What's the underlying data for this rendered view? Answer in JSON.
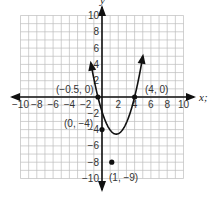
{
  "chart_data": {
    "type": "line",
    "title": "",
    "xlabel": "x",
    "ylabel": "y",
    "xlim": [
      -10,
      10
    ],
    "ylim": [
      -10,
      10
    ],
    "grid": true,
    "grid_step": 1,
    "x_ticks": [
      -10,
      -8,
      -6,
      -4,
      -2,
      2,
      4,
      6,
      8,
      10
    ],
    "y_ticks": [
      -10,
      -8,
      -6,
      -4,
      -2,
      2,
      4,
      6,
      8,
      10
    ],
    "x_tick_labels": [
      "−10",
      "−8",
      "−6",
      "−4",
      "−2",
      "2",
      "4",
      "6",
      "8",
      "10"
    ],
    "y_tick_labels": [
      "−10",
      "−8",
      "−6",
      "−4",
      "−2",
      "2",
      "4",
      "6",
      "8",
      "10"
    ],
    "series": [
      {
        "name": "parabola",
        "description": "Upward-opening parabola through labeled points, arrows at both ends",
        "points": [
          {
            "x": -0.5,
            "y": 0,
            "label": "(−0.5, 0)"
          },
          {
            "x": 0,
            "y": -4,
            "label": "(0, −4)"
          },
          {
            "x": 1,
            "y": -9,
            "label": "(1, −9)"
          },
          {
            "x": 4,
            "y": 0,
            "label": "(4, 0)"
          }
        ]
      }
    ],
    "annotations": [
      "(−0.5, 0)",
      "(4, 0)",
      "(0, −4)",
      "(1, −9)"
    ]
  },
  "axes": {
    "x_label": "x;",
    "y_label": "y"
  },
  "labels": {
    "p1": "(−0.5, 0)",
    "p2": "(4, 0)",
    "p3": "(0, −4)",
    "p4": "(1, −9)"
  },
  "ticks": {
    "x": [
      "−10",
      "−8",
      "−6",
      "−4",
      "−2",
      "2",
      "4",
      "6",
      "8",
      "10"
    ],
    "y": [
      "10",
      "8",
      "6",
      "4",
      "2",
      "−2",
      "−4",
      "−6",
      "−8",
      "−10"
    ]
  }
}
